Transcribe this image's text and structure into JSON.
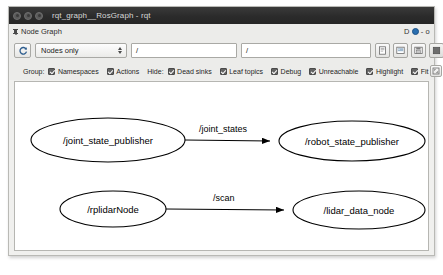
{
  "window": {
    "title": "rqt_graph__RosGraph - rqt",
    "buttons": [
      "close-button",
      "minimize-button",
      "maximize-button"
    ]
  },
  "dock": {
    "title": "Node Graph",
    "pin_icon": "pin-icon",
    "float_icon": "float-icon",
    "undock_label": "D",
    "separator": "-",
    "close_label": "o"
  },
  "toolbar": {
    "refresh_icon": "refresh-icon",
    "graph_type": {
      "value": "Nodes only",
      "options": [
        "Nodes only",
        "Nodes/Topics (active)",
        "Nodes/Topics (all)"
      ]
    },
    "filter_include": {
      "value": "/",
      "placeholder": "/"
    },
    "filter_exclude": {
      "value": "/",
      "placeholder": "/"
    },
    "actions": [
      {
        "name": "save-dot-button",
        "icon": "file-icon"
      },
      {
        "name": "save-svg-button",
        "icon": "image-icon"
      },
      {
        "name": "save-image-button",
        "icon": "image-save-icon"
      },
      {
        "name": "fit-view-button",
        "icon": "square-icon"
      }
    ]
  },
  "options": {
    "group_label": "Group:",
    "group_items": [
      {
        "label": "Namespaces",
        "checked": true
      },
      {
        "label": "Actions",
        "checked": true
      }
    ],
    "hide_label": "Hide:",
    "hide_items": [
      {
        "label": "Dead sinks",
        "checked": true
      },
      {
        "label": "Leaf topics",
        "checked": true
      },
      {
        "label": "Debug",
        "checked": true
      },
      {
        "label": "Unreachable",
        "checked": true
      }
    ],
    "view_items": [
      {
        "label": "Highlight",
        "checked": true
      },
      {
        "label": "Fit",
        "checked": true
      }
    ],
    "fit_button_icon": "fit-icon"
  },
  "graph": {
    "nodes": [
      {
        "id": "joint_state_publisher",
        "label": "/joint_state_publisher",
        "cx": 93,
        "cy": 58,
        "rx": 77,
        "ry": 22
      },
      {
        "id": "robot_state_publisher",
        "label": "/robot_state_publisher",
        "cx": 337,
        "cy": 59,
        "rx": 73,
        "ry": 20
      },
      {
        "id": "rplidarNode",
        "label": "/rplidarNode",
        "cx": 98,
        "cy": 127,
        "rx": 53,
        "ry": 18
      },
      {
        "id": "lidar_data_node",
        "label": "/lidar_data_node",
        "cx": 344,
        "cy": 128,
        "rx": 66,
        "ry": 19
      }
    ],
    "edges": [
      {
        "id": "joint_states",
        "label": "/joint_states",
        "x1": 170,
        "y1": 58,
        "x2": 262,
        "y2": 59,
        "lx": 184,
        "ly": 50
      },
      {
        "id": "scan",
        "label": "/scan",
        "x1": 151,
        "y1": 127,
        "x2": 276,
        "y2": 128,
        "lx": 198,
        "ly": 119
      }
    ]
  },
  "colors": {
    "titlebar": "#2b2b2b",
    "chrome": "#ececea",
    "canvas": "#ffffff",
    "accent": "#2a6fb0",
    "checkbox": "#636363"
  }
}
